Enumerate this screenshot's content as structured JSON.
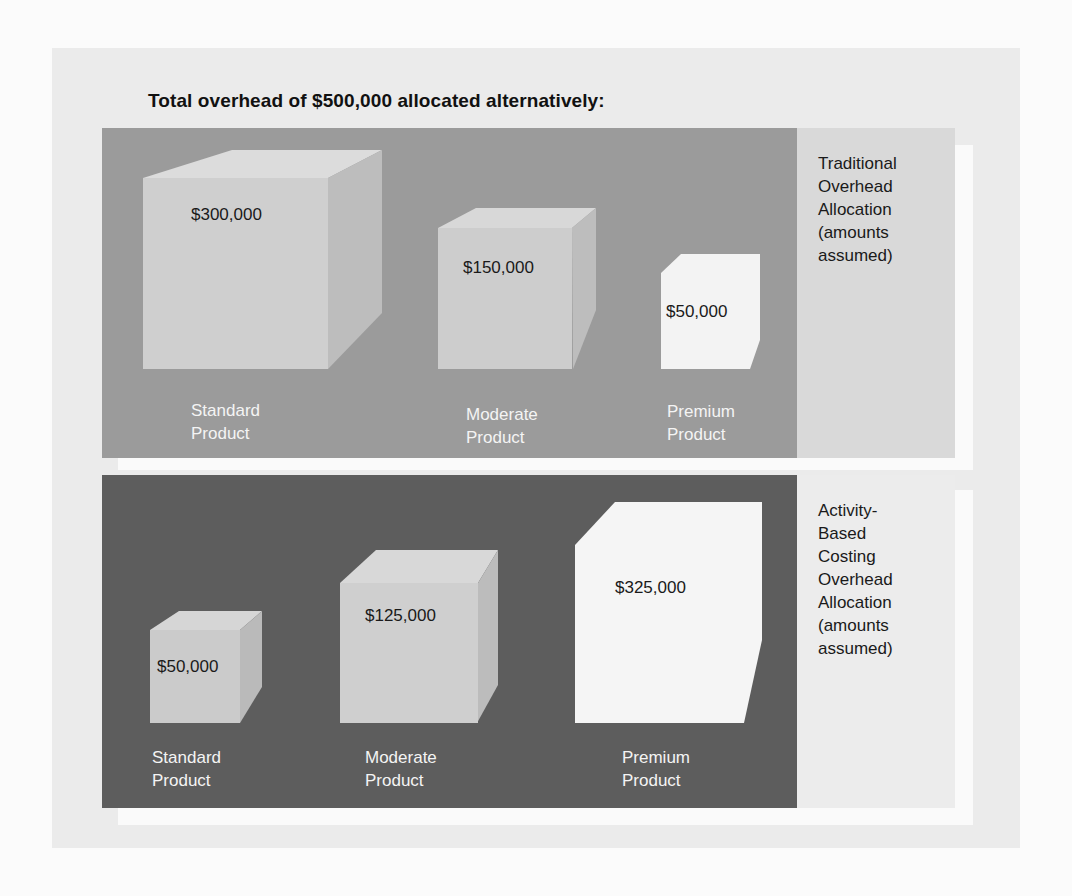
{
  "title": "Total overhead of $500,000 allocated alternatively:",
  "traditional": {
    "side_label": "Traditional\nOverhead\nAllocation\n(amounts\nassumed)",
    "products": [
      {
        "name": "Standard\nProduct",
        "amount": "$300,000"
      },
      {
        "name": "Moderate\nProduct",
        "amount": "$150,000"
      },
      {
        "name": "Premium\nProduct",
        "amount": "$50,000"
      }
    ]
  },
  "abc": {
    "side_label": "Activity-\nBased\nCosting\nOverhead\nAllocation\n(amounts\nassumed)",
    "products": [
      {
        "name": "Standard\nProduct",
        "amount": "$50,000"
      },
      {
        "name": "Moderate\nProduct",
        "amount": "$125,000"
      },
      {
        "name": "Premium\nProduct",
        "amount": "$325,000"
      }
    ]
  },
  "colors": {
    "top_panel": "#9b9b9b",
    "bottom_panel": "#5d5d5d",
    "outer_bg": "#ebebeb"
  }
}
